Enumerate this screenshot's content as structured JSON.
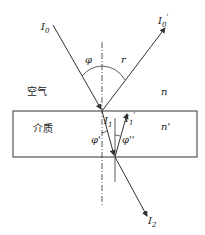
{
  "diagram": {
    "type": "optics-reflection-refraction",
    "labels": {
      "incident_ray": "I",
      "incident_sub": "0",
      "reflected_ray": "I",
      "reflected_sub": "0",
      "reflected_prime": "'",
      "refracted_ray": "I",
      "refracted_sub": "1",
      "internal_reflected_ray": "I",
      "internal_reflected_sub": "1",
      "internal_reflected_prime": "'",
      "transmitted_ray": "I",
      "transmitted_sub": "2",
      "angle_incidence": "φ",
      "angle_reflection": "r",
      "angle_refraction": "φ'",
      "angle_internal": "φ''",
      "medium_top_name": "空气",
      "medium_top_index": "n",
      "medium_bottom_name": "介质",
      "medium_bottom_index": "n'"
    },
    "colors": {
      "line": "#333333",
      "background": "#ffffff"
    }
  }
}
